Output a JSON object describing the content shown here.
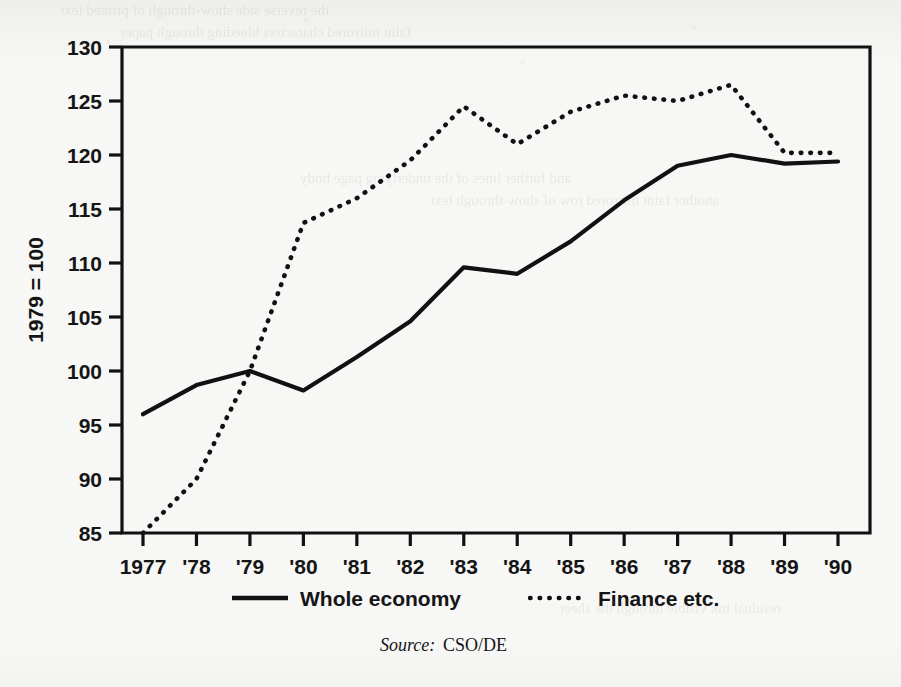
{
  "chart_data": {
    "type": "line",
    "title": "",
    "xlabel": "",
    "ylabel": "1979 = 100",
    "x": [
      1977,
      1978,
      1979,
      1980,
      1981,
      1982,
      1983,
      1984,
      1985,
      1986,
      1987,
      1988,
      1989,
      1990
    ],
    "categories": [
      "1977",
      "'78",
      "'79",
      "'80",
      "'81",
      "'82",
      "'83",
      "'84",
      "'85",
      "'86",
      "'87",
      "'88",
      "'89",
      "'90"
    ],
    "ylim": [
      85,
      130
    ],
    "yticks": [
      85,
      90,
      95,
      100,
      105,
      110,
      115,
      120,
      125,
      130
    ],
    "ytick_labels": [
      "85",
      "90",
      "95",
      "100",
      "105",
      "110",
      "115",
      "120",
      "125",
      "130"
    ],
    "grid": false,
    "legend_position": "below-axis",
    "series": [
      {
        "name": "Whole economy",
        "style": "solid",
        "color": "#111111",
        "values": [
          96.0,
          98.7,
          100.0,
          98.2,
          101.3,
          104.6,
          109.6,
          109.0,
          112.0,
          115.8,
          119.0,
          120.0,
          119.2,
          119.4
        ]
      },
      {
        "name": "Finance etc.",
        "style": "dotted",
        "color": "#111111",
        "values": [
          85.0,
          90.0,
          100.0,
          113.7,
          116.0,
          119.5,
          124.5,
          121.0,
          124.0,
          125.5,
          125.0,
          126.5,
          120.2,
          120.2
        ]
      }
    ],
    "annotations": []
  },
  "legend": {
    "items": [
      {
        "label": "Whole economy",
        "marker": "solid-line-swatch"
      },
      {
        "label": "Finance etc.",
        "marker": "dotted-line-swatch"
      }
    ]
  },
  "source": {
    "prefix": "Source:",
    "text": "CSO/DE"
  },
  "ghost_text": {
    "lines": [
      "the reverse side show-through of printed text",
      "faint mirrored characters bleeding through paper",
      "and further lines of the underlying page body",
      "another faint mirrored row of show-through text",
      "residual ink visible through the sheet"
    ]
  },
  "colors": {
    "ink": "#111111",
    "paper": "#f7f7f5"
  }
}
